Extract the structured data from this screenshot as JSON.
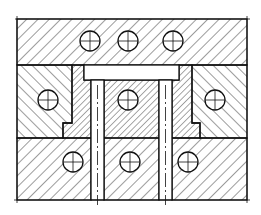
{
  "diagram": {
    "type": "mechanical-cross-section",
    "width": 261,
    "height": 215,
    "stroke_color": "#111111",
    "background": "#ffffff",
    "outline": {
      "x1": 17,
      "y1": 19,
      "x2": 247,
      "y2": 200
    },
    "regions": {
      "top_plate": "hatched right-leaning",
      "middle_left_block": "hatched left-leaning",
      "middle_right_block": "hatched left-leaning",
      "left_stepped_insert": "fine hatch right-leaning",
      "right_stepped_insert": "fine hatch right-leaning",
      "center_core": "fine hatch right-leaning",
      "bottom_plate": "hatched right-leaning",
      "cap_bar": "unhatched",
      "pins": "unhatched (2)"
    },
    "holes": {
      "top_row": [
        {
          "cx": 90,
          "cy": 41
        },
        {
          "cx": 128,
          "cy": 41
        },
        {
          "cx": 173,
          "cy": 41
        }
      ],
      "middle_row": [
        {
          "cx": 48,
          "cy": 100
        },
        {
          "cx": 128,
          "cy": 100
        },
        {
          "cx": 215,
          "cy": 100
        }
      ],
      "bottom_row": [
        {
          "cx": 73,
          "cy": 162
        },
        {
          "cx": 130,
          "cy": 162
        },
        {
          "cx": 188,
          "cy": 162
        }
      ],
      "radius": 10
    }
  }
}
